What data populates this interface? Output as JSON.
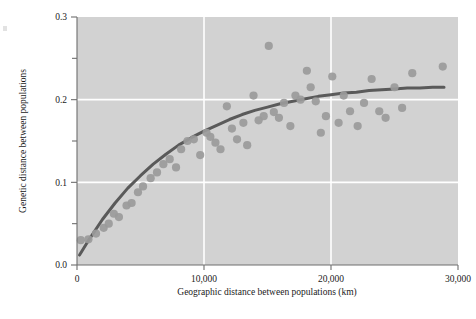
{
  "figure": {
    "background": "#ffffff",
    "plot_background": "#d2d2d2",
    "gridline_color": "#ffffff",
    "axis_color": "#6e6e6e",
    "point_color": "#9a9a9a",
    "curve_color": "#5a5a5a"
  },
  "chart_data": {
    "type": "scatter",
    "title": "",
    "xlabel": "Geographic distance between populations (km)",
    "ylabel": "Genetic distance between populations",
    "xlim": [
      0,
      30000
    ],
    "ylim": [
      0.0,
      0.3
    ],
    "xticks": [
      0,
      10000,
      20000,
      30000
    ],
    "xticklabels": [
      "0",
      "10,000",
      "20,000",
      "30,000"
    ],
    "yticks": [
      0.0,
      0.05,
      0.1,
      0.15,
      0.2,
      0.25,
      0.3
    ],
    "yticklabels": [
      "0.0",
      "",
      "0.1",
      "",
      "0.2",
      "",
      "0.3"
    ],
    "grid": {
      "x_gridlines": [
        10000,
        20000
      ],
      "y_gridlines": [
        0.1,
        0.2
      ],
      "color": "#ffffff"
    },
    "legend": null,
    "series": [
      {
        "name": "population pairs",
        "type": "scatter",
        "marker": "circle",
        "color": "#9a9a9a",
        "points": [
          [
            300,
            0.03
          ],
          [
            900,
            0.031
          ],
          [
            1500,
            0.038
          ],
          [
            2100,
            0.045
          ],
          [
            2500,
            0.05
          ],
          [
            2900,
            0.062
          ],
          [
            3300,
            0.058
          ],
          [
            3900,
            0.072
          ],
          [
            4300,
            0.075
          ],
          [
            4800,
            0.088
          ],
          [
            5200,
            0.095
          ],
          [
            5800,
            0.105
          ],
          [
            6300,
            0.112
          ],
          [
            6800,
            0.122
          ],
          [
            7300,
            0.128
          ],
          [
            7800,
            0.118
          ],
          [
            8200,
            0.14
          ],
          [
            8700,
            0.15
          ],
          [
            9200,
            0.152
          ],
          [
            9700,
            0.133
          ],
          [
            10200,
            0.16
          ],
          [
            10500,
            0.155
          ],
          [
            10900,
            0.148
          ],
          [
            11300,
            0.14
          ],
          [
            11800,
            0.192
          ],
          [
            12200,
            0.165
          ],
          [
            12600,
            0.152
          ],
          [
            13100,
            0.172
          ],
          [
            13400,
            0.145
          ],
          [
            13900,
            0.205
          ],
          [
            14300,
            0.175
          ],
          [
            14700,
            0.18
          ],
          [
            15100,
            0.265
          ],
          [
            15500,
            0.185
          ],
          [
            15900,
            0.178
          ],
          [
            16300,
            0.196
          ],
          [
            16800,
            0.168
          ],
          [
            17200,
            0.205
          ],
          [
            17600,
            0.2
          ],
          [
            18100,
            0.235
          ],
          [
            18400,
            0.215
          ],
          [
            18800,
            0.198
          ],
          [
            19200,
            0.16
          ],
          [
            19600,
            0.18
          ],
          [
            20100,
            0.228
          ],
          [
            20600,
            0.172
          ],
          [
            21000,
            0.205
          ],
          [
            21500,
            0.186
          ],
          [
            22100,
            0.168
          ],
          [
            22600,
            0.196
          ],
          [
            23200,
            0.225
          ],
          [
            23800,
            0.186
          ],
          [
            24300,
            0.178
          ],
          [
            25000,
            0.215
          ],
          [
            25600,
            0.19
          ],
          [
            26400,
            0.232
          ],
          [
            28800,
            0.24
          ]
        ]
      },
      {
        "name": "fitted curve",
        "type": "line",
        "color": "#5a5a5a",
        "points": [
          [
            200,
            0.012
          ],
          [
            1000,
            0.032
          ],
          [
            2000,
            0.055
          ],
          [
            3000,
            0.075
          ],
          [
            4000,
            0.093
          ],
          [
            5000,
            0.108
          ],
          [
            6000,
            0.122
          ],
          [
            7000,
            0.134
          ],
          [
            8000,
            0.145
          ],
          [
            9000,
            0.154
          ],
          [
            10000,
            0.162
          ],
          [
            11000,
            0.169
          ],
          [
            12000,
            0.176
          ],
          [
            13000,
            0.182
          ],
          [
            14000,
            0.187
          ],
          [
            15000,
            0.191
          ],
          [
            16000,
            0.195
          ],
          [
            17000,
            0.198
          ],
          [
            18000,
            0.201
          ],
          [
            19000,
            0.204
          ],
          [
            20000,
            0.206
          ],
          [
            21000,
            0.208
          ],
          [
            22000,
            0.209
          ],
          [
            23000,
            0.211
          ],
          [
            24000,
            0.212
          ],
          [
            25000,
            0.213
          ],
          [
            26000,
            0.214
          ],
          [
            27000,
            0.214
          ],
          [
            28000,
            0.215
          ],
          [
            28900,
            0.215
          ]
        ]
      }
    ]
  }
}
